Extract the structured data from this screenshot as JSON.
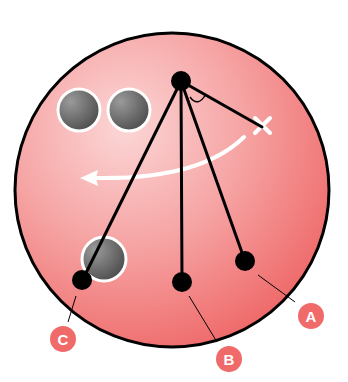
{
  "diagram": {
    "colors": {
      "ball": "#f07070",
      "ball_highlight": "#fbd3d3",
      "outline": "#000000",
      "finger_hole": "#666666",
      "label_bg": "#f06a6a",
      "arrow": "#ffffff"
    },
    "labels": {
      "a": "A",
      "b": "B",
      "c": "C"
    },
    "elements": {
      "pivot": "pivot-point",
      "marker": "x-marker",
      "arrow": "rotation-arrow",
      "holes": [
        "finger-hole-left",
        "finger-hole-right",
        "thumb-hole"
      ]
    }
  }
}
